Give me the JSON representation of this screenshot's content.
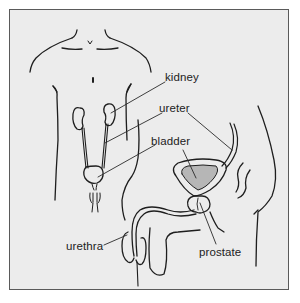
{
  "figure": {
    "background_color": "#ececec",
    "border_color": "#5a5a5a",
    "line_color": "#1e1e1e",
    "views": [
      "front-view-torso",
      "side-view-pelvis"
    ]
  },
  "labels": {
    "kidney": "kidney",
    "ureter": "ureter",
    "bladder": "bladder",
    "urethra": "urethra",
    "prostate": "prostate"
  }
}
